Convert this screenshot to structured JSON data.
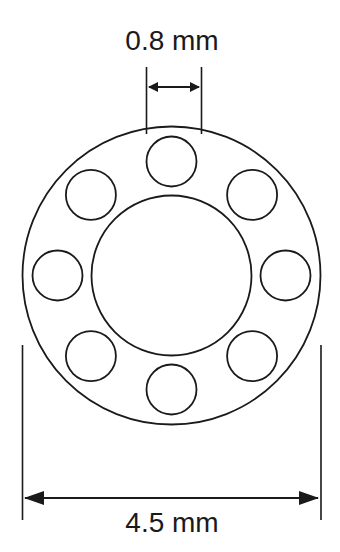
{
  "diagram": {
    "labels": {
      "small_diameter": "0.8 mm",
      "outer_diameter": "4.5 mm"
    },
    "components": {
      "outer_circle": "outer-sheath",
      "inner_circle": "central-lumen",
      "small_circles_count": 8
    },
    "colors": {
      "stroke": "#1a1a1a",
      "background": "#ffffff"
    }
  }
}
